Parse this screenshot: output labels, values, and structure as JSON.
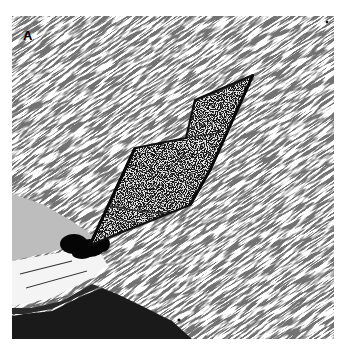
{
  "figure": {
    "panel_label": "A",
    "caption_fragment": "",
    "colors": {
      "background": "#ffffff",
      "crystal_fill": "#e6e6e6",
      "crystal_edge": "#111111",
      "dark_region": "#1a1a1a",
      "gray_region": "#bdbdbd"
    }
  }
}
